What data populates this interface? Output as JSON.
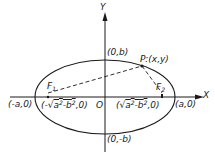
{
  "diagram": {
    "type": "ellipse-with-foci",
    "colors": {
      "stroke": "#1a1a1a",
      "background": "#ffffff"
    },
    "axes": {
      "x_label": "X",
      "y_label": "Y",
      "origin_label": "O"
    },
    "ellipse": {
      "center": [
        105,
        97
      ],
      "rx": 70,
      "ry": 37
    },
    "points": {
      "vertex_left": {
        "label": "(-a,0)"
      },
      "vertex_right": {
        "label": "(a,0)"
      },
      "covertex_top": {
        "label": "(0,b)"
      },
      "covertex_bottom": {
        "label": "(0,-b)"
      },
      "focus_left": {
        "name": "F",
        "sub": "1",
        "coord_prefix": "(-",
        "coord_a": "a",
        "coord_mid": "-b",
        "coord_suffix": ",0)"
      },
      "focus_right": {
        "name": "F",
        "sub": "2",
        "coord_prefix": "(",
        "coord_a": "a",
        "coord_mid": "-b",
        "coord_suffix": ",0)"
      },
      "point_p": {
        "label": "P:(x,y)"
      }
    },
    "segments": [
      {
        "from": "focus_left",
        "to": "point_p",
        "style": "dashed"
      },
      {
        "from": "point_p",
        "to": "focus_right",
        "style": "dashed"
      }
    ]
  }
}
